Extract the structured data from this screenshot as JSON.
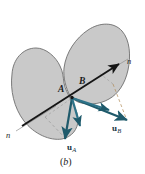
{
  "figure": {
    "caption": "(b)",
    "caption_open": "(",
    "caption_letter": "b",
    "caption_close": ")",
    "background_color": "#ffffff",
    "body_fill_color": "#c9c9c9",
    "body_outline_color": "#6e6e6e",
    "vector_color": "#1f5a6b",
    "normal_line_color": "#1a1a1a",
    "normal_ray_color": "#8a8a8a",
    "dashed_line_color": "#9a9a9a"
  },
  "bodies": [
    {
      "id": "body-A",
      "name": "body-a-blob",
      "description": "left kidney-shaped body"
    },
    {
      "id": "body-B",
      "name": "body-b-blob",
      "description": "right kidney-shaped body"
    }
  ],
  "labels": {
    "point_A": "A",
    "point_B": "B",
    "normal_left": "n",
    "normal_right": "n",
    "velocity_A_base": "u",
    "velocity_A_sub": "A",
    "velocity_A_full": "uA",
    "velocity_B_base": "u",
    "velocity_B_sub": "B",
    "velocity_B_full": "uB"
  },
  "vectors": [
    {
      "name": "normal-line-arrow",
      "label": "n",
      "color": "#1a1a1a",
      "from": [
        18,
        128
      ],
      "to": [
        120,
        63
      ],
      "style": "solid-arrow"
    },
    {
      "name": "velocity-a-arrow",
      "label": "uA",
      "color": "#1f5a6b",
      "from": [
        72,
        98
      ],
      "to": [
        64,
        141
      ],
      "style": "solid-arrow"
    },
    {
      "name": "velocity-b-arrow",
      "label": "uB",
      "color": "#1f5a6b",
      "from": [
        72,
        98
      ],
      "to": [
        128,
        121
      ],
      "style": "solid-arrow"
    },
    {
      "name": "velocity-a-normal-component",
      "color": "#1f5a6b",
      "from": [
        72,
        98
      ],
      "to": [
        79,
        128
      ],
      "style": "solid-arrow"
    },
    {
      "name": "velocity-b-normal-component",
      "color": "#1f5a6b",
      "from": [
        72,
        98
      ],
      "to": [
        110,
        112
      ],
      "style": "solid-arrow"
    }
  ]
}
